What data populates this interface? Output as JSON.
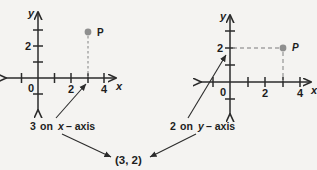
{
  "figure": {
    "title_absent": true,
    "background_color": "#f4f3f1",
    "stroke_color": "#2b2b2b",
    "accent_color": "#9a9a9a"
  },
  "left_plot": {
    "name": "x-coordinate-plot",
    "x_axis_label": "x",
    "y_axis_label": "y",
    "origin_label": "0",
    "x_ticks": [
      "2",
      "4"
    ],
    "y_ticks": [
      "2"
    ],
    "point": {
      "label": "P",
      "x": 3,
      "y": 2,
      "drop_line": "dotted-vertical-to-x-axis"
    }
  },
  "right_plot": {
    "name": "y-coordinate-plot",
    "x_axis_label": "x",
    "y_axis_label": "y",
    "origin_label": "0",
    "x_ticks": [
      "2",
      "4"
    ],
    "y_ticks": [
      "2"
    ],
    "point": {
      "label": "P",
      "x": 3,
      "y": 2,
      "drop_line": "dashed-vertical-to-x-axis",
      "guide_line": "dashed-horizontal-to-y-axis"
    }
  },
  "annotations": {
    "left_callout_number": "3",
    "left_callout_text": "on",
    "left_callout_axis_var": "x",
    "left_callout_suffix": "– axis",
    "right_callout_number": "2",
    "right_callout_text": "on",
    "right_callout_axis_var": "y",
    "right_callout_suffix": "– axis",
    "result": "(3, 2)"
  }
}
